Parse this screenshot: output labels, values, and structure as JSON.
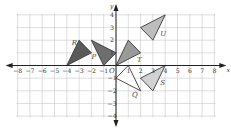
{
  "diagram": {
    "x_axis": {
      "label": "x",
      "min": -8,
      "max": 8,
      "ticks": [
        "-8",
        "-7",
        "-6",
        "-5",
        "-4",
        "-3",
        "-2",
        "-1",
        "1",
        "2",
        "3",
        "4",
        "5",
        "6",
        "7",
        "8"
      ]
    },
    "y_axis": {
      "label": "y",
      "min": -4,
      "max": 4,
      "ticks": [
        "4",
        "3",
        "2",
        "1",
        "-1",
        "-2",
        "-3",
        "-4"
      ]
    },
    "origin_label": "O",
    "triangles": [
      {
        "label": "R",
        "vertices": [
          [
            -4,
            0
          ],
          [
            -3,
            2
          ],
          [
            -2,
            1
          ]
        ],
        "fill": "#5a5a5a",
        "label_pos": [
          -3.6,
          1.6
        ]
      },
      {
        "label": "P",
        "vertices": [
          [
            -2,
            2
          ],
          [
            -1,
            0
          ],
          [
            0,
            1
          ]
        ],
        "fill": "#6e6e6e",
        "label_pos": [
          -2.0,
          0.55
        ]
      },
      {
        "label": "T",
        "vertices": [
          [
            0,
            0
          ],
          [
            1,
            2
          ],
          [
            2,
            1
          ]
        ],
        "fill": "#9a9a9a",
        "label_pos": [
          1.7,
          0.25
        ]
      },
      {
        "label": "U",
        "vertices": [
          [
            2,
            3
          ],
          [
            4,
            4
          ],
          [
            3,
            2
          ]
        ],
        "fill": "#bdbdbd",
        "label_pos": [
          3.6,
          2.3
        ]
      },
      {
        "label": "Q",
        "vertices": [
          [
            0,
            -1
          ],
          [
            1,
            0
          ],
          [
            2,
            -2
          ]
        ],
        "fill": "#ffffff",
        "label_pos": [
          1.3,
          -2.5
        ]
      },
      {
        "label": "S",
        "vertices": [
          [
            2,
            -1
          ],
          [
            4,
            0
          ],
          [
            3,
            -2
          ]
        ],
        "fill": "#d2d2d2",
        "label_pos": [
          3.6,
          -1.55
        ]
      }
    ]
  }
}
